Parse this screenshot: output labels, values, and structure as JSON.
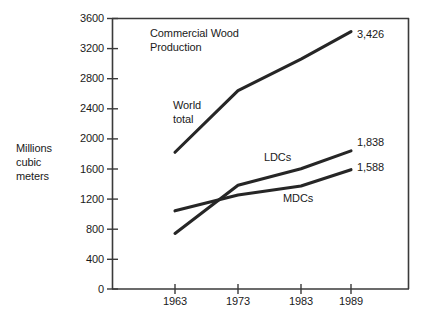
{
  "chart_data": {
    "type": "line",
    "title": "Commercial Wood\nProduction",
    "title_line1": "Commercial Wood",
    "title_line2": "Production",
    "xlabel": "",
    "ylabel": "Millions\ncubic\nmeters",
    "ylabel_line1": "Millions",
    "ylabel_line2": "cubic",
    "ylabel_line3": "meters",
    "x": [
      1963,
      1973,
      1983,
      1989
    ],
    "categories": [
      "1963",
      "1973",
      "1983",
      "1989"
    ],
    "xlim": [
      1960,
      1992
    ],
    "ylim": [
      0,
      3600
    ],
    "yticks": [
      0,
      400,
      800,
      1200,
      1600,
      2000,
      2400,
      2800,
      3200,
      3600
    ],
    "ytick_labels": [
      "0",
      "400",
      "800",
      "1200",
      "1600",
      "2000",
      "2400",
      "2800",
      "3200",
      "3600"
    ],
    "xticks": [
      1963,
      1973,
      1983,
      1989
    ],
    "xtick_labels": [
      "1963",
      "1973",
      "1983",
      "1989"
    ],
    "grid": false,
    "legend": "inline-annotations",
    "line_color": "#262626",
    "axis_color": "#3a3a3a",
    "background": "#ffffff",
    "series": [
      {
        "name": "World total",
        "label": "World\ntotal",
        "label_line1": "World",
        "label_line2": "total",
        "values": [
          1820,
          2640,
          3060,
          3426
        ],
        "end_label": "3,426"
      },
      {
        "name": "LDCs",
        "label": "LDCs",
        "values": [
          740,
          1380,
          1600,
          1838
        ],
        "end_label": "1,838"
      },
      {
        "name": "MDCs",
        "label": "MDCs",
        "values": [
          1040,
          1250,
          1370,
          1588
        ],
        "end_label": "1,588"
      }
    ],
    "annotations": [
      {
        "text": "3,426",
        "series": "World total",
        "at_x": 1989
      },
      {
        "text": "1,838",
        "series": "LDCs",
        "at_x": 1989
      },
      {
        "text": "1,588",
        "series": "MDCs",
        "at_x": 1989
      }
    ]
  }
}
